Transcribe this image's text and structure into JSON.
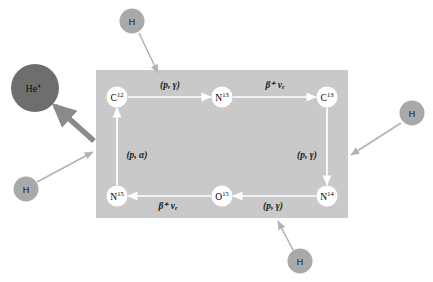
{
  "diagram": {
    "type": "cycle-diagram",
    "colors": {
      "background": "#ffffff",
      "box_fill": "#c9c9c9",
      "node_fill": "#ffffff",
      "node_stroke": "#ffffff",
      "cycle_arrow": "#ffffff",
      "hydrogen_fill": "#a9a9a9",
      "helium_fill": "#6e6e6e",
      "input_arrow": "#b3b3b3",
      "helium_arrow": "#8a8a8a",
      "text": "#111111"
    },
    "box": {
      "name": "cno-cycle-box",
      "x": 96,
      "y": 70,
      "width": 252,
      "height": 148
    },
    "nodes": [
      {
        "id": "c12",
        "element": "C",
        "mass": "12",
        "x": 117,
        "y": 97
      },
      {
        "id": "n13",
        "element": "N",
        "mass": "13",
        "x": 222,
        "y": 97
      },
      {
        "id": "c13",
        "element": "C",
        "mass": "13",
        "x": 327,
        "y": 97
      },
      {
        "id": "n14",
        "element": "N",
        "mass": "14",
        "x": 327,
        "y": 196
      },
      {
        "id": "o15",
        "element": "O",
        "mass": "15",
        "x": 222,
        "y": 196
      },
      {
        "id": "n15",
        "element": "N",
        "mass": "15",
        "x": 117,
        "y": 196
      }
    ],
    "reactions": [
      {
        "id": "c12-n13",
        "from": "c12",
        "to": "n13",
        "label": "(p, γ)",
        "label_kind": "paren",
        "label_x": 170,
        "label_y": 88
      },
      {
        "id": "n13-c13",
        "from": "n13",
        "to": "c13",
        "label": "β⁺ νₑ",
        "label_kind": "beta",
        "label_x": 275,
        "label_y": 88
      },
      {
        "id": "c13-n14",
        "from": "c13",
        "to": "n14",
        "label": "(p, γ)",
        "label_kind": "paren",
        "label_x": 305,
        "label_y": 158
      },
      {
        "id": "n14-o15",
        "from": "n14",
        "to": "o15",
        "label": "(p, γ)",
        "label_kind": "paren",
        "label_x": 273,
        "label_y": 209
      },
      {
        "id": "o15-n15",
        "from": "o15",
        "to": "n15",
        "label": "β⁺ νₑ",
        "label_kind": "beta",
        "label_x": 168,
        "label_y": 209
      },
      {
        "id": "n15-c12",
        "from": "n15",
        "to": "c12",
        "label": "(p, α)",
        "label_kind": "paren",
        "label_x": 137,
        "label_y": 158
      }
    ],
    "hydrogen_inputs": [
      {
        "id": "h-top",
        "label": "H",
        "cx": 132,
        "cy": 21,
        "arrow_to_x": 158,
        "arrow_to_y": 73
      },
      {
        "id": "h-right",
        "label": "H",
        "cx": 412,
        "cy": 113,
        "arrow_to_x": 351,
        "arrow_to_y": 155
      },
      {
        "id": "h-bottom",
        "label": "H",
        "cx": 300,
        "cy": 261,
        "arrow_to_x": 278,
        "arrow_to_y": 221
      },
      {
        "id": "h-left",
        "label": "H",
        "cx": 26,
        "cy": 189,
        "arrow_to_x": 93,
        "arrow_to_y": 152
      }
    ],
    "helium_output": {
      "id": "he4",
      "element": "He",
      "mass": "4",
      "cx": 35,
      "cy": 88,
      "r": 24,
      "arrow_from_x": 94,
      "arrow_from_y": 141,
      "arrow_to_x": 53,
      "arrow_to_y": 105
    }
  }
}
